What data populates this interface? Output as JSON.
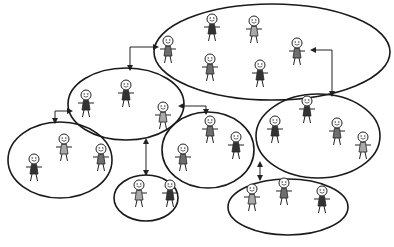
{
  "diagram": {
    "title": "",
    "colors": {
      "dark": "#333333",
      "medium": "#6e6e6e",
      "light": "#a8a8a8",
      "stroke": "#1a1a1a",
      "background": "#ffffff"
    },
    "groups": [
      {
        "id": "top",
        "cx": 272,
        "cy": 52,
        "rx": 118,
        "ry": 48,
        "members": [
          {
            "x": 168,
            "y": 50,
            "shade": "medium"
          },
          {
            "x": 212,
            "y": 28,
            "shade": "dark"
          },
          {
            "x": 254,
            "y": 30,
            "shade": "light"
          },
          {
            "x": 297,
            "y": 52,
            "shade": "medium"
          },
          {
            "x": 210,
            "y": 68,
            "shade": "medium"
          },
          {
            "x": 260,
            "y": 74,
            "shade": "dark"
          }
        ]
      },
      {
        "id": "left-mid",
        "cx": 126,
        "cy": 104,
        "rx": 58,
        "ry": 36,
        "members": [
          {
            "x": 86,
            "y": 104,
            "shade": "dark"
          },
          {
            "x": 126,
            "y": 94,
            "shade": "dark"
          },
          {
            "x": 163,
            "y": 116,
            "shade": "light"
          }
        ]
      },
      {
        "id": "center",
        "cx": 208,
        "cy": 150,
        "rx": 46,
        "ry": 38,
        "members": [
          {
            "x": 210,
            "y": 130,
            "shade": "medium"
          },
          {
            "x": 183,
            "y": 158,
            "shade": "medium"
          },
          {
            "x": 236,
            "y": 146,
            "shade": "dark"
          }
        ]
      },
      {
        "id": "right",
        "cx": 318,
        "cy": 136,
        "rx": 62,
        "ry": 42,
        "members": [
          {
            "x": 275,
            "y": 130,
            "shade": "dark"
          },
          {
            "x": 307,
            "y": 110,
            "shade": "dark"
          },
          {
            "x": 337,
            "y": 132,
            "shade": "medium"
          },
          {
            "x": 363,
            "y": 146,
            "shade": "light"
          }
        ]
      },
      {
        "id": "far-left",
        "cx": 60,
        "cy": 160,
        "rx": 52,
        "ry": 38,
        "members": [
          {
            "x": 34,
            "y": 168,
            "shade": "dark"
          },
          {
            "x": 64,
            "y": 148,
            "shade": "light"
          },
          {
            "x": 101,
            "y": 158,
            "shade": "medium"
          }
        ]
      },
      {
        "id": "bottom-small",
        "cx": 146,
        "cy": 198,
        "rx": 32,
        "ry": 23,
        "members": [
          {
            "x": 139,
            "y": 194,
            "shade": "light"
          },
          {
            "x": 170,
            "y": 194,
            "shade": "dark"
          }
        ]
      },
      {
        "id": "bottom-right",
        "cx": 288,
        "cy": 207,
        "rx": 60,
        "ry": 28,
        "members": [
          {
            "x": 252,
            "y": 198,
            "shade": "light"
          },
          {
            "x": 284,
            "y": 192,
            "shade": "medium"
          },
          {
            "x": 322,
            "y": 200,
            "shade": "dark"
          }
        ]
      }
    ],
    "connections": [
      {
        "from": "top",
        "to": "left-mid",
        "path": "M 154 47 L 130 47 L 130 70",
        "arrow_start": true,
        "arrow_end": true
      },
      {
        "from": "top",
        "to": "right",
        "path": "M 315 50 L 332 50 L 332 96",
        "arrow_start": true,
        "arrow_end": true
      },
      {
        "from": "left-mid",
        "to": "center",
        "path": "M 183 106 L 206 106 L 206 114",
        "arrow_start": true,
        "arrow_end": true
      },
      {
        "from": "left-mid",
        "to": "far-left",
        "path": "M 68 111 L 55 111 L 55 123",
        "arrow_start": true,
        "arrow_end": true
      },
      {
        "from": "left-mid",
        "to": "bottom-small",
        "path": "M 146 143 L 146 175",
        "arrow_start": true,
        "arrow_end": true
      },
      {
        "from": "right",
        "to": "bottom-right",
        "path": "M 260 166 L 260 180",
        "arrow_start": true,
        "arrow_end": true
      }
    ]
  }
}
